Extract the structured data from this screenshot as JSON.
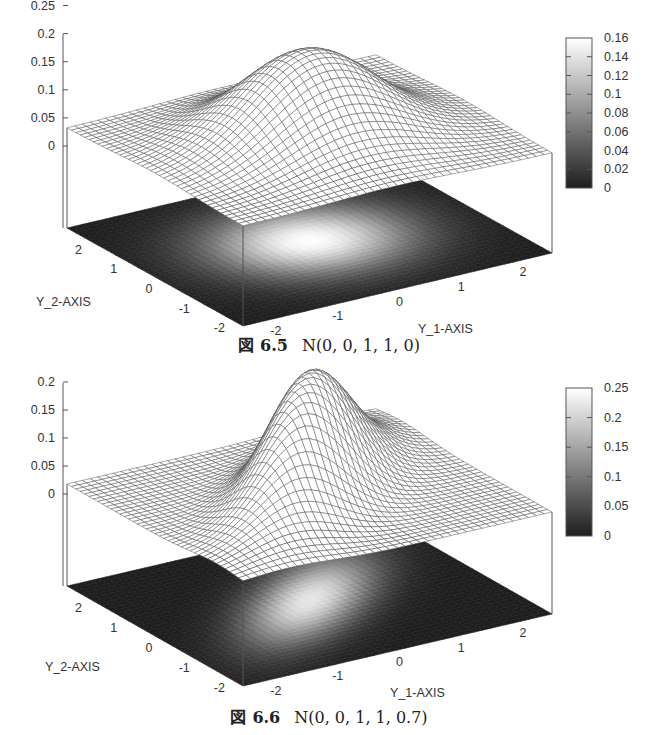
{
  "figures": [
    {
      "id": "fig1",
      "caption": {
        "mark": "図",
        "number": "6.5",
        "formula": "N(0, 0, 1, 1, 0)"
      },
      "chart_data": {
        "type": "surface",
        "title": "",
        "function": "bivariate normal density",
        "params": {
          "mu1": 0,
          "mu2": 0,
          "sigma1": 1,
          "sigma2": 1,
          "rho": 0
        },
        "xlabel": "Y_1-AXIS",
        "ylabel": "Y_2-AXIS",
        "zlabel": "",
        "x_ticks": [
          "-2",
          "-1",
          "0",
          "1",
          "2"
        ],
        "y_ticks": [
          "-2",
          "-1",
          "0",
          "1",
          "2"
        ],
        "z_ticks": [
          "0",
          "0.05",
          "0.1",
          "0.15",
          "0.2",
          "0.25"
        ],
        "xlim": [
          -2.5,
          2.5
        ],
        "ylim": [
          -2.5,
          2.5
        ],
        "zlim": [
          0,
          0.25
        ],
        "peak_value": 0.159,
        "colorbar": {
          "ticks": [
            "0",
            "0.02",
            "0.04",
            "0.06",
            "0.08",
            "0.1",
            "0.12",
            "0.14",
            "0.16"
          ],
          "range": [
            0,
            0.16
          ],
          "colormap": "gray"
        },
        "projection_map": "pm3d at bottom (grayscale heat map)",
        "grid": false
      }
    },
    {
      "id": "fig2",
      "caption": {
        "mark": "図",
        "number": "6.6",
        "formula": "N(0, 0, 1, 1, 0.7)"
      },
      "chart_data": {
        "type": "surface",
        "title": "",
        "function": "bivariate normal density",
        "params": {
          "mu1": 0,
          "mu2": 0,
          "sigma1": 1,
          "sigma2": 1,
          "rho": 0.7
        },
        "xlabel": "Y_1-AXIS",
        "ylabel": "Y_2-AXIS",
        "zlabel": "",
        "x_ticks": [
          "-2",
          "-1",
          "0",
          "1",
          "2"
        ],
        "y_ticks": [
          "-2",
          "-1",
          "0",
          "1",
          "2"
        ],
        "z_ticks": [
          "0",
          "0.05",
          "0.1",
          "0.15",
          "0.2",
          "0.25"
        ],
        "xlim": [
          -2.5,
          2.5
        ],
        "ylim": [
          -2.5,
          2.5
        ],
        "zlim": [
          0,
          0.25
        ],
        "peak_value": 0.223,
        "colorbar": {
          "ticks": [
            "0",
            "0.05",
            "0.1",
            "0.15",
            "0.2",
            "0.25"
          ],
          "range": [
            0,
            0.25
          ],
          "colormap": "gray"
        },
        "projection_map": "pm3d at bottom (grayscale heat map)",
        "grid": false
      }
    }
  ]
}
